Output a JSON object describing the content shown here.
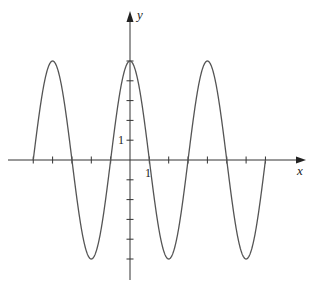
{
  "chart_data": {
    "type": "line",
    "title": "",
    "xlabel": "x",
    "ylabel": "y",
    "function": "y = 5 cos(pi x / 2)",
    "amplitude": 5,
    "period": 4,
    "x_domain": [
      -5,
      7
    ],
    "xlim": [
      -6.5,
      8.8
    ],
    "ylim": [
      -6.1,
      7.6
    ],
    "grid": false,
    "legend": null,
    "x_ticks": [
      -5,
      -4,
      -3,
      -2,
      -1,
      0,
      1,
      2,
      3,
      4,
      5,
      6,
      7
    ],
    "y_ticks": [
      -5,
      -4,
      -3,
      -2,
      -1,
      0,
      1,
      2,
      3,
      4,
      5
    ],
    "tick_labels": {
      "x": "1",
      "y": "1"
    },
    "key_points": [
      {
        "x": -5,
        "y": 0
      },
      {
        "x": -4,
        "y": 5
      },
      {
        "x": -3,
        "y": 0
      },
      {
        "x": -2,
        "y": -5
      },
      {
        "x": -1,
        "y": 0
      },
      {
        "x": 0,
        "y": 5
      },
      {
        "x": 1,
        "y": 0
      },
      {
        "x": 2,
        "y": -5
      },
      {
        "x": 3,
        "y": 0
      },
      {
        "x": 4,
        "y": 5
      },
      {
        "x": 5,
        "y": 0
      },
      {
        "x": 6,
        "y": -5
      },
      {
        "x": 7,
        "y": 0
      }
    ],
    "colors": {
      "curve": "#555555",
      "axes": "#333333"
    }
  }
}
